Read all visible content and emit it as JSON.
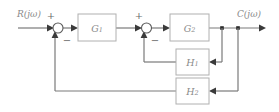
{
  "diagram": {
    "input_label": "R(jω)",
    "output_label": "C(jω)",
    "blocks": [
      {
        "id": "g1",
        "label": "G",
        "subscript": "1"
      },
      {
        "id": "g2",
        "label": "G",
        "subscript": "2"
      },
      {
        "id": "h1",
        "label": "H",
        "subscript": "1"
      },
      {
        "id": "h2",
        "label": "H",
        "subscript": "2"
      }
    ],
    "summing_junctions": [
      {
        "id": "sum1",
        "plus_sign": "+",
        "minus_sign": "−"
      },
      {
        "id": "sum2",
        "plus_sign": "+",
        "minus_sign": "−"
      }
    ],
    "colors": {
      "wire": "#7a7a7a",
      "block_border": "#b0b0b0",
      "label_text": "#8a8a8a",
      "background": "#ffffff"
    }
  }
}
